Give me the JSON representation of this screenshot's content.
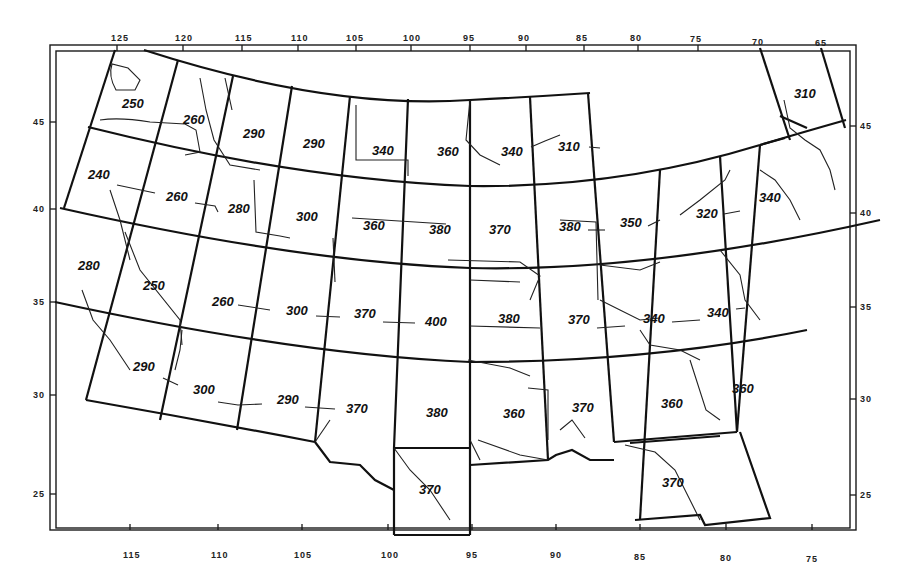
{
  "map": {
    "type": "grid-value-map",
    "region": "Contiguous United States",
    "top_lon_ticks": [
      {
        "label": "125",
        "x": 117
      },
      {
        "label": "120",
        "x": 183
      },
      {
        "label": "115",
        "x": 242
      },
      {
        "label": "110",
        "x": 298
      },
      {
        "label": "105",
        "x": 356
      },
      {
        "label": "100",
        "x": 411
      },
      {
        "label": "95",
        "x": 470
      },
      {
        "label": "90",
        "x": 526
      },
      {
        "label": "85",
        "x": 584
      },
      {
        "label": "80",
        "x": 638
      },
      {
        "label": "75",
        "x": 698
      },
      {
        "label": "70",
        "x": 760
      },
      {
        "label": "65",
        "x": 822
      }
    ],
    "bottom_lon_ticks": [
      {
        "label": "115",
        "x": 130
      },
      {
        "label": "110",
        "x": 218
      },
      {
        "label": "105",
        "x": 302
      },
      {
        "label": "100",
        "x": 388
      },
      {
        "label": "95",
        "x": 472
      },
      {
        "label": "90",
        "x": 556
      },
      {
        "label": "85",
        "x": 640
      },
      {
        "label": "80",
        "x": 726
      },
      {
        "label": "75",
        "x": 812
      }
    ],
    "left_lat_ticks": [
      {
        "label": "45",
        "y": 122
      },
      {
        "label": "40",
        "y": 209
      },
      {
        "label": "35",
        "y": 302
      },
      {
        "label": "30",
        "y": 395
      },
      {
        "label": "25",
        "y": 494
      }
    ],
    "right_lat_ticks": [
      {
        "label": "45",
        "y": 126
      },
      {
        "label": "40",
        "y": 213
      },
      {
        "label": "35",
        "y": 307
      },
      {
        "label": "30",
        "y": 399
      },
      {
        "label": "25",
        "y": 495
      }
    ],
    "cell_values": [
      {
        "row": 1,
        "label": "250",
        "x": 128,
        "y": 107
      },
      {
        "row": 1,
        "label": "260",
        "x": 196,
        "y": 123
      },
      {
        "row": 1,
        "label": "290",
        "x": 255,
        "y": 137
      },
      {
        "row": 1,
        "label": "290",
        "x": 315,
        "y": 147
      },
      {
        "row": 1,
        "label": "340",
        "x": 383,
        "y": 154
      },
      {
        "row": 1,
        "label": "360",
        "x": 450,
        "y": 155
      },
      {
        "row": 1,
        "label": "340",
        "x": 514,
        "y": 155
      },
      {
        "row": 1,
        "label": "310",
        "x": 571,
        "y": 150
      },
      {
        "row": 1,
        "label": "310",
        "x": 806,
        "y": 97
      },
      {
        "row": 2,
        "label": "240",
        "x": 99,
        "y": 178
      },
      {
        "row": 2,
        "label": "260",
        "x": 178,
        "y": 200
      },
      {
        "row": 2,
        "label": "280",
        "x": 240,
        "y": 212
      },
      {
        "row": 2,
        "label": "300",
        "x": 308,
        "y": 220
      },
      {
        "row": 2,
        "label": "360",
        "x": 375,
        "y": 229
      },
      {
        "row": 2,
        "label": "380",
        "x": 441,
        "y": 233
      },
      {
        "row": 2,
        "label": "370",
        "x": 501,
        "y": 233
      },
      {
        "row": 2,
        "label": "380",
        "x": 571,
        "y": 230
      },
      {
        "row": 2,
        "label": "350",
        "x": 632,
        "y": 226
      },
      {
        "row": 2,
        "label": "320",
        "x": 707,
        "y": 217
      },
      {
        "row": 2,
        "label": "340",
        "x": 770,
        "y": 201
      },
      {
        "row": 3,
        "label": "280",
        "x": 89,
        "y": 269
      },
      {
        "row": 3,
        "label": "250",
        "x": 154,
        "y": 289
      },
      {
        "row": 3,
        "label": "260",
        "x": 224,
        "y": 305
      },
      {
        "row": 3,
        "label": "300",
        "x": 298,
        "y": 314
      },
      {
        "row": 3,
        "label": "370",
        "x": 366,
        "y": 317
      },
      {
        "row": 3,
        "label": "400",
        "x": 437,
        "y": 325
      },
      {
        "row": 3,
        "label": "380",
        "x": 510,
        "y": 322
      },
      {
        "row": 3,
        "label": "370",
        "x": 580,
        "y": 323
      },
      {
        "row": 3,
        "label": "340",
        "x": 655,
        "y": 322
      },
      {
        "row": 3,
        "label": "340",
        "x": 719,
        "y": 316
      },
      {
        "row": 4,
        "label": "290",
        "x": 144,
        "y": 370
      },
      {
        "row": 4,
        "label": "300",
        "x": 204,
        "y": 393
      },
      {
        "row": 4,
        "label": "290",
        "x": 288,
        "y": 403
      },
      {
        "row": 4,
        "label": "370",
        "x": 357,
        "y": 412
      },
      {
        "row": 4,
        "label": "380",
        "x": 437,
        "y": 416
      },
      {
        "row": 4,
        "label": "360",
        "x": 514,
        "y": 417
      },
      {
        "row": 4,
        "label": "370",
        "x": 583,
        "y": 411
      },
      {
        "row": 4,
        "label": "360",
        "x": 672,
        "y": 407
      },
      {
        "row": 4,
        "label": "360",
        "x": 743,
        "y": 392
      },
      {
        "row": 5,
        "label": "370",
        "x": 430,
        "y": 493
      },
      {
        "row": 5,
        "label": "370",
        "x": 673,
        "y": 486
      }
    ]
  }
}
